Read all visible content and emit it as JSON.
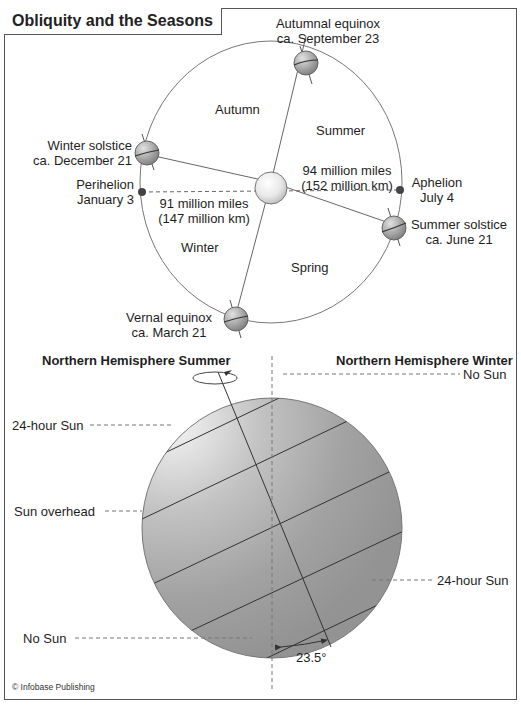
{
  "title": "Obliquity and the Seasons",
  "orbit": {
    "seasons": {
      "autumn": "Autumn",
      "summer": "Summer",
      "winter": "Winter",
      "spring": "Spring"
    },
    "positions": {
      "autumnal_equinox": {
        "name": "Autumnal equinox",
        "date": "ca. September 23"
      },
      "winter_solstice": {
        "name": "Winter solstice",
        "date": "ca. December 21"
      },
      "summer_solstice": {
        "name": "Summer solstice",
        "date": "ca. June 21"
      },
      "vernal_equinox": {
        "name": "Vernal equinox",
        "date": "ca. March 21"
      }
    },
    "perihelion": {
      "name": "Perihelion",
      "date": "January 3",
      "distance_miles": "91 million miles",
      "distance_km": "(147 million km)"
    },
    "aphelion": {
      "name": "Aphelion",
      "date": "July 4",
      "distance_miles": "94 million miles",
      "distance_km": "(152 million km)"
    }
  },
  "globe": {
    "nh_summer": "Northern Hemisphere Summer",
    "nh_winter": "Northern Hemisphere Winter",
    "labels": {
      "no_sun_top": "No Sun",
      "sun_24_left": "24-hour Sun",
      "sun_overhead": "Sun overhead",
      "sun_24_right": "24-hour Sun",
      "no_sun_bottom": "No Sun"
    },
    "tilt": "23.5°"
  },
  "credit": "© Infobase Publishing"
}
